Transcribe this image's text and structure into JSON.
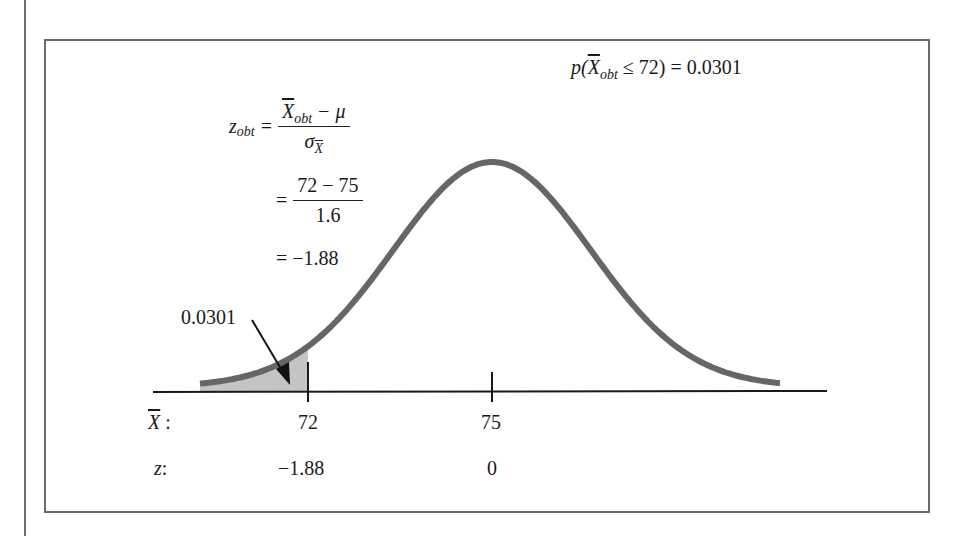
{
  "figure": {
    "title_prob": {
      "p": "p(",
      "xbar": "X",
      "sub": "obt",
      "rest": " ≤ 72) = 0.0301"
    },
    "zformula": {
      "lhs_var": "z",
      "lhs_sub": "obt",
      "eq": "=",
      "line1_num_var": "X",
      "line1_num_sub": "obt",
      "line1_num_rest": " − μ",
      "line1_den_var": "σ",
      "line1_den_sub": "X",
      "line2_num": "72 − 75",
      "line2_den": "1.6",
      "line3": "= −1.88"
    },
    "shaded_label": "0.0301",
    "axis_rows": {
      "xbar_label": "X",
      "xbar_colon": " :",
      "z_label": "z",
      "z_colon": ":"
    },
    "ticks": [
      {
        "xbar": "72",
        "z": "−1.88"
      },
      {
        "xbar": "75",
        "z": "0"
      }
    ],
    "colors": {
      "curve": "#666666",
      "shade": "#c4c4c4",
      "axis": "#1a1a1a",
      "frame": "#6a6a6a"
    }
  },
  "chart_data": {
    "type": "area",
    "distribution": {
      "mean": 75,
      "standard_error": 1.6
    },
    "x_axis": {
      "label": "X̄",
      "ticks": [
        72,
        75
      ]
    },
    "z_axis": {
      "label": "z",
      "ticks": [
        -1.88,
        0
      ]
    },
    "shaded_region": {
      "from": "-inf",
      "to": 72,
      "z_to": -1.88,
      "area": 0.0301
    },
    "annotations": [
      "z_obt = (X̄_obt − μ) / σ_X̄",
      "= (72 − 75) / 1.6",
      "= −1.88",
      "0.0301"
    ],
    "grid": false,
    "legend": null
  }
}
